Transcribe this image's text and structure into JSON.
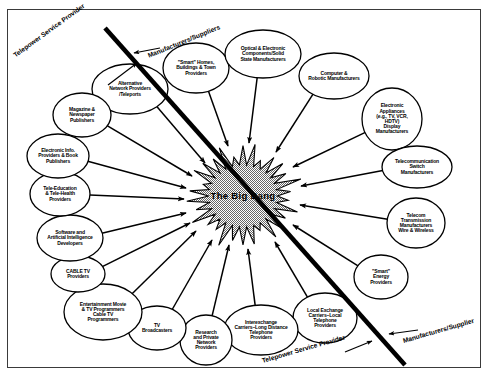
{
  "figure": {
    "title": "The Big Bang",
    "center_label": "The Big Bang",
    "frame_color": "#3a3a3a",
    "ink_color": "#000000",
    "burst_fill": "#b4b4b4"
  },
  "axis_labels": [
    {
      "id": "telepower-top",
      "text": "Telepower Service Provider",
      "x": 14,
      "y": 52,
      "rotate": -36,
      "size": 6.6
    },
    {
      "id": "manufacturers-top",
      "text": "Manufacturers/Suppliers",
      "x": 148,
      "y": 52,
      "rotate": -22,
      "size": 6.6
    },
    {
      "id": "telepower-bottom",
      "text": "Telepower Service Provider",
      "x": 262,
      "y": 357,
      "rotate": -16,
      "size": 6.6
    },
    {
      "id": "manufacturers-bottom",
      "text": "Manufacturers/Supplier",
      "x": 403,
      "y": 337,
      "rotate": -16,
      "size": 6.6
    }
  ],
  "divider": {
    "name": "telepower-manufacturers-divider",
    "x1": 105,
    "y1": 28,
    "x2": 405,
    "y2": 365,
    "width": 4.6
  },
  "burst": {
    "cx": 243,
    "cy": 196,
    "rx": 52,
    "ry": 47,
    "spikes": 30
  },
  "nodes": [
    {
      "id": "alternative-network-providers",
      "label": "Alternative\nNetwork Providers\n/Teleports",
      "cx": 130,
      "cy": 89,
      "rx": 38,
      "ry": 25,
      "size": 5.0,
      "tip_x": 205,
      "tip_y": 163
    },
    {
      "id": "smart-homes-buildings-towns",
      "label": "\"Smart\" Homes,\nBuildings & Town\nProviders",
      "cx": 196,
      "cy": 68,
      "rx": 33,
      "ry": 25,
      "size": 5.0,
      "tip_x": 228,
      "tip_y": 146
    },
    {
      "id": "optical-electronic-components",
      "label": "Optical & Electronic\nComponents/Solid\nState Manufacturers",
      "cx": 263,
      "cy": 54,
      "rx": 38,
      "ry": 24,
      "size": 5.0,
      "tip_x": 249,
      "tip_y": 143
    },
    {
      "id": "computer-robotic-manufacturers",
      "label": "Computer &\nRobotic Manufacturers",
      "cx": 334,
      "cy": 76,
      "rx": 35,
      "ry": 23,
      "size": 5.0,
      "tip_x": 276,
      "tip_y": 152
    },
    {
      "id": "electronic-appliances-display",
      "label": "Electronic\nAppliances\n(e.g., TV, VCR,\nHDTV)\nDisplay\nManufacturers",
      "cx": 392,
      "cy": 119,
      "rx": 30,
      "ry": 31,
      "size": 5.0,
      "tip_x": 293,
      "tip_y": 167
    },
    {
      "id": "telecommunication-switch-manufacturers",
      "label": "Telecommunication\nSwitch\nManufacturers",
      "cx": 417,
      "cy": 167,
      "rx": 35,
      "ry": 21,
      "size": 5.0,
      "tip_x": 301,
      "tip_y": 186
    },
    {
      "id": "telecom-transmission-manufacturers",
      "label": "Telecom\nTransmission\nManufacturers\nWire & Wireless",
      "cx": 416,
      "cy": 223,
      "rx": 29,
      "ry": 25,
      "size": 5.0,
      "tip_x": 300,
      "tip_y": 205
    },
    {
      "id": "smart-energy-providers",
      "label": "\"Smart\"\nEnergy\nProviders",
      "cx": 381,
      "cy": 277,
      "rx": 27,
      "ry": 22,
      "size": 5.0,
      "tip_x": 293,
      "tip_y": 225
    },
    {
      "id": "local-exchange-carriers",
      "label": "Local Exchange\nCarriers–Local\nTelephone\nProviders",
      "cx": 325,
      "cy": 318,
      "rx": 32,
      "ry": 25,
      "size": 5.0,
      "tip_x": 275,
      "tip_y": 242
    },
    {
      "id": "interexchange-carriers",
      "label": "Interexchange\nCarriers–Long Distance\nTelephone\nProviders",
      "cx": 261,
      "cy": 330,
      "rx": 37,
      "ry": 25,
      "size": 5.0,
      "tip_x": 248,
      "tip_y": 249
    },
    {
      "id": "research-private-network-providers",
      "label": "Research\nand Private\nNetwork\nProviders",
      "cx": 206,
      "cy": 340,
      "rx": 26,
      "ry": 25,
      "size": 5.0,
      "tip_x": 229,
      "tip_y": 245
    },
    {
      "id": "tv-broadcasters",
      "label": "TV\nBroadcasters",
      "cx": 157,
      "cy": 328,
      "rx": 29,
      "ry": 22,
      "size": 5.0,
      "tip_x": 212,
      "tip_y": 240
    },
    {
      "id": "entertainment-movie-tv-programmers",
      "label": "Entertainment Movie\n&  TV Programmers\nCable TV\nProgrammers",
      "cx": 103,
      "cy": 312,
      "rx": 39,
      "ry": 28,
      "size": 5.0,
      "tip_x": 196,
      "tip_y": 231
    },
    {
      "id": "cable-tv-providers",
      "label": "CABLE TV\nProviders",
      "cx": 78,
      "cy": 274,
      "rx": 27,
      "ry": 18,
      "size": 5.0,
      "tip_x": 190,
      "tip_y": 223
    },
    {
      "id": "software-ai-developers",
      "label": "Software and\nArtificial Intelligence\nDevelopers",
      "cx": 70,
      "cy": 238,
      "rx": 33,
      "ry": 23,
      "size": 5.0,
      "tip_x": 186,
      "tip_y": 213
    },
    {
      "id": "tele-education-tele-health",
      "label": "Tele-Education\n& Tele-Health\nProviders",
      "cx": 60,
      "cy": 194,
      "rx": 30,
      "ry": 22,
      "size": 5.0,
      "tip_x": 184,
      "tip_y": 199
    },
    {
      "id": "electronic-info-book-publishers",
      "label": "Electronic Info.\nProviders & Book\nPublishers",
      "cx": 58,
      "cy": 156,
      "rx": 31,
      "ry": 22,
      "size": 5.0,
      "tip_x": 186,
      "tip_y": 188
    },
    {
      "id": "magazine-newspaper-publishers",
      "label": "Magazine &\nNewspaper\nPublishers",
      "cx": 82,
      "cy": 115,
      "rx": 29,
      "ry": 22,
      "size": 5.0,
      "tip_x": 192,
      "tip_y": 176
    }
  ]
}
